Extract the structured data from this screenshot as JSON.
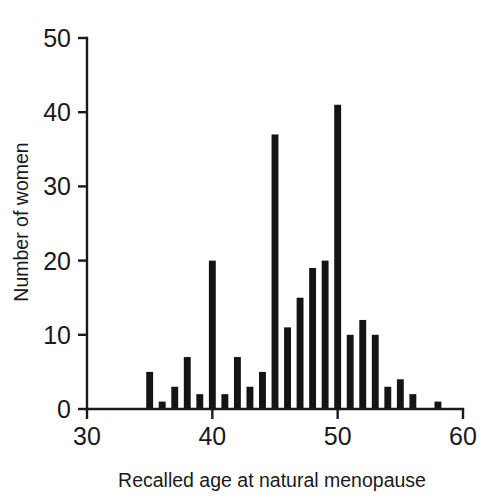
{
  "figure": {
    "background_color": "#ffffff",
    "ink_color": "#141414"
  },
  "chart_data": {
    "type": "bar",
    "title": "",
    "subtitle": "",
    "xlabel": "Recalled age at natural menopause",
    "ylabel": "Number of women",
    "xlim": [
      30,
      60
    ],
    "ylim": [
      0,
      50
    ],
    "grid": false,
    "legend": null,
    "annotations": [],
    "x_ticks": [
      30,
      40,
      50,
      60
    ],
    "x_tick_labels": [
      "30",
      "40",
      "50",
      "60"
    ],
    "y_ticks": [
      0,
      10,
      20,
      30,
      40,
      50
    ],
    "y_tick_labels": [
      "0",
      "10",
      "20",
      "30",
      "40",
      "50"
    ],
    "bar_width_years": 0.55,
    "categories": [
      35,
      36,
      37,
      38,
      39,
      40,
      41,
      42,
      43,
      44,
      45,
      46,
      47,
      48,
      49,
      50,
      51,
      52,
      53,
      54,
      55,
      56,
      58
    ],
    "values": [
      5,
      1,
      3,
      7,
      2,
      20,
      2,
      7,
      3,
      5,
      37,
      11,
      15,
      19,
      20,
      41,
      10,
      12,
      10,
      3,
      4,
      2,
      1
    ],
    "series": [
      {
        "name": "Number of women",
        "values": [
          5,
          1,
          3,
          7,
          2,
          20,
          2,
          7,
          3,
          5,
          37,
          11,
          15,
          19,
          20,
          41,
          10,
          12,
          10,
          3,
          4,
          2,
          1
        ]
      }
    ]
  }
}
